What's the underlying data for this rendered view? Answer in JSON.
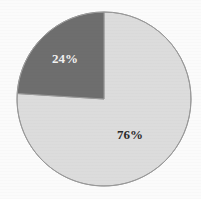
{
  "chart_data": {
    "type": "pie",
    "title": "",
    "subtitle": "",
    "xlabel": "",
    "ylabel": "",
    "grid": false,
    "legend_position": "none",
    "categories": [
      "Slice 1",
      "Slice 2"
    ],
    "values": [
      76,
      24
    ],
    "labels": [
      "76%",
      "24%"
    ],
    "colors": [
      "#dcdcdc",
      "#6e6e6e"
    ],
    "label_colors": [
      "#2b2b2b",
      "#f2f2f2"
    ],
    "start_angle_deg": 0,
    "direction": "clockwise",
    "slices": [
      {
        "name": "slice-light",
        "label": "76%",
        "value": 76,
        "color": "#dcdcdc",
        "label_color": "#2b2b2b",
        "start_angle_deg": 0,
        "end_angle_deg": 273.6,
        "label_x": 130,
        "label_y": 134
      },
      {
        "name": "slice-dark",
        "label": "24%",
        "value": 24,
        "color": "#6e6e6e",
        "label_color": "#f2f2f2",
        "start_angle_deg": 273.6,
        "end_angle_deg": 360,
        "label_x": 65,
        "label_y": 58
      }
    ]
  },
  "figure": {
    "background_color": "#fbfbfb",
    "outline_color": "#999999",
    "center_x": 104,
    "center_y": 99,
    "radius": 87
  }
}
